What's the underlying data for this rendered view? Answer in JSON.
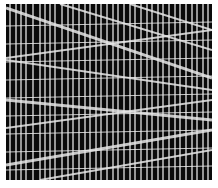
{
  "image": {
    "description": "Black field overlaid with a dense grid of white vertical lines and several slanted near-horizontal white lines",
    "background": "#ffffff",
    "field": {
      "x": 6,
      "y": 4,
      "width": 206,
      "height": 176,
      "color": "#0a0a0a"
    },
    "line_color": "#e6e6e6",
    "vertical_lines_x": [
      10,
      16,
      21,
      26,
      33,
      40,
      45,
      50,
      55,
      62,
      68,
      73,
      79,
      85,
      90,
      96,
      101,
      107,
      113,
      118,
      124,
      130,
      135,
      141,
      147,
      152,
      158,
      163,
      169,
      175,
      180,
      186,
      192,
      197,
      203,
      208
    ],
    "horizontal_lines_y": [
      26,
      44,
      62,
      80,
      98,
      116,
      134,
      152,
      170
    ],
    "slanted_lines": [
      {
        "x1": 6,
        "y1": 8,
        "x2": 212,
        "y2": 78,
        "w": 3
      },
      {
        "x1": 60,
        "y1": 4,
        "x2": 212,
        "y2": 50,
        "w": 2
      },
      {
        "x1": 130,
        "y1": 4,
        "x2": 212,
        "y2": 30,
        "w": 2
      },
      {
        "x1": 6,
        "y1": 58,
        "x2": 212,
        "y2": 30,
        "w": 2
      },
      {
        "x1": 6,
        "y1": 100,
        "x2": 212,
        "y2": 120,
        "w": 3
      },
      {
        "x1": 6,
        "y1": 128,
        "x2": 212,
        "y2": 100,
        "w": 2
      },
      {
        "x1": 6,
        "y1": 165,
        "x2": 212,
        "y2": 130,
        "w": 3
      },
      {
        "x1": 40,
        "y1": 180,
        "x2": 212,
        "y2": 150,
        "w": 2
      },
      {
        "x1": 6,
        "y1": 60,
        "x2": 212,
        "y2": 90,
        "w": 2
      }
    ]
  }
}
